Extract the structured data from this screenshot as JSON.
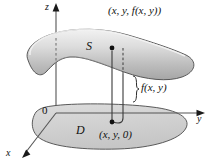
{
  "figure": {
    "background_color": "#ffffff",
    "stroke_color": "#1a1a1a",
    "surface_fill_light": "#e8e8e8",
    "surface_fill_mid": "#c9c9c9",
    "surface_fill_dark": "#a8a8a8",
    "region_fill": "#d2d2d2"
  },
  "axes": {
    "z_label": "z",
    "y_label": "y",
    "x_label": "x",
    "origin_label": "0"
  },
  "labels": {
    "point_top": "(x, y, f(x, y))",
    "surface": "S",
    "height": "f(x, y)",
    "point_bottom": "(x, y, 0)",
    "region": "D"
  }
}
